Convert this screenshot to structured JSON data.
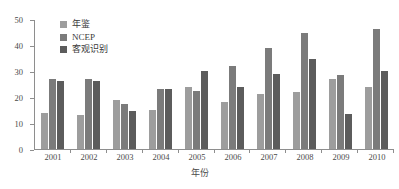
{
  "chart_data": {
    "type": "bar",
    "title": "",
    "xlabel": "年份",
    "ylabel": "",
    "categories": [
      "2001",
      "2002",
      "2003",
      "2004",
      "2005",
      "2006",
      "2007",
      "2008",
      "2009",
      "2010"
    ],
    "ylim": [
      0,
      50
    ],
    "yticks": [
      0,
      10,
      20,
      30,
      40,
      50
    ],
    "grid": false,
    "legend_position": "top-left",
    "series": [
      {
        "name": "年鉴",
        "color": "#9d9d9d",
        "values": [
          14,
          13,
          19,
          15,
          24,
          18,
          21,
          22,
          27,
          24
        ]
      },
      {
        "name": "NCEP",
        "color": "#7b7b7b",
        "values": [
          27,
          27,
          17.5,
          23,
          22.5,
          32,
          39,
          44.5,
          28.5,
          46
        ]
      },
      {
        "name": "客观识别",
        "color": "#5c5c5c",
        "values": [
          26,
          26,
          14.5,
          23,
          30,
          24,
          29,
          34.5,
          13.5,
          30
        ]
      }
    ]
  },
  "axis": {
    "y_tick_labels": [
      "0",
      "10",
      "20",
      "30",
      "40",
      "50"
    ],
    "x_tick_labels": [
      "2001",
      "2002",
      "2003",
      "2004",
      "2005",
      "2006",
      "2007",
      "2008",
      "2009",
      "2010"
    ],
    "x_title": "年份"
  },
  "legend": {
    "items": [
      {
        "label": "年鉴"
      },
      {
        "label": "NCEP"
      },
      {
        "label": "客观识别"
      }
    ]
  }
}
